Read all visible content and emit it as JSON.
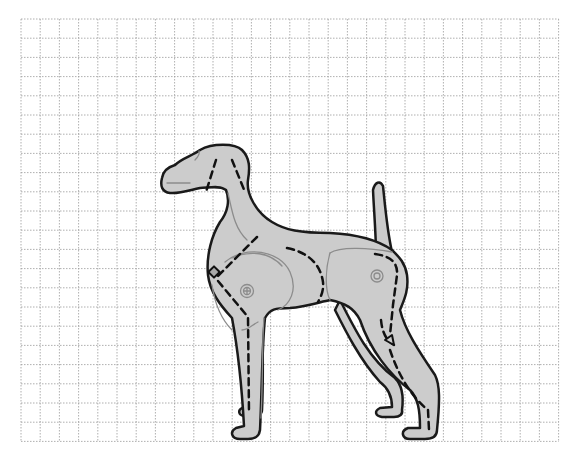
{
  "diagram": {
    "background": "#ffffff",
    "grid": {
      "origin_x": 21,
      "origin_y": 19,
      "cell": 19.2,
      "cols": 28,
      "rows": 22,
      "color": "#9a9a9a",
      "style": "dotted"
    },
    "figure": {
      "subject": "dog (pointer) side profile",
      "fill": "#cccccc",
      "outline": "#1a1a1a",
      "detail_line": "#8c8c8c",
      "cut_line": "#111111",
      "cut_style": "dashed",
      "joints": [
        "front-shoulder-joint",
        "rear-hip-joint"
      ],
      "markers": [
        "chest-diamond-marker",
        "rear-leg-angle-marker"
      ]
    }
  }
}
